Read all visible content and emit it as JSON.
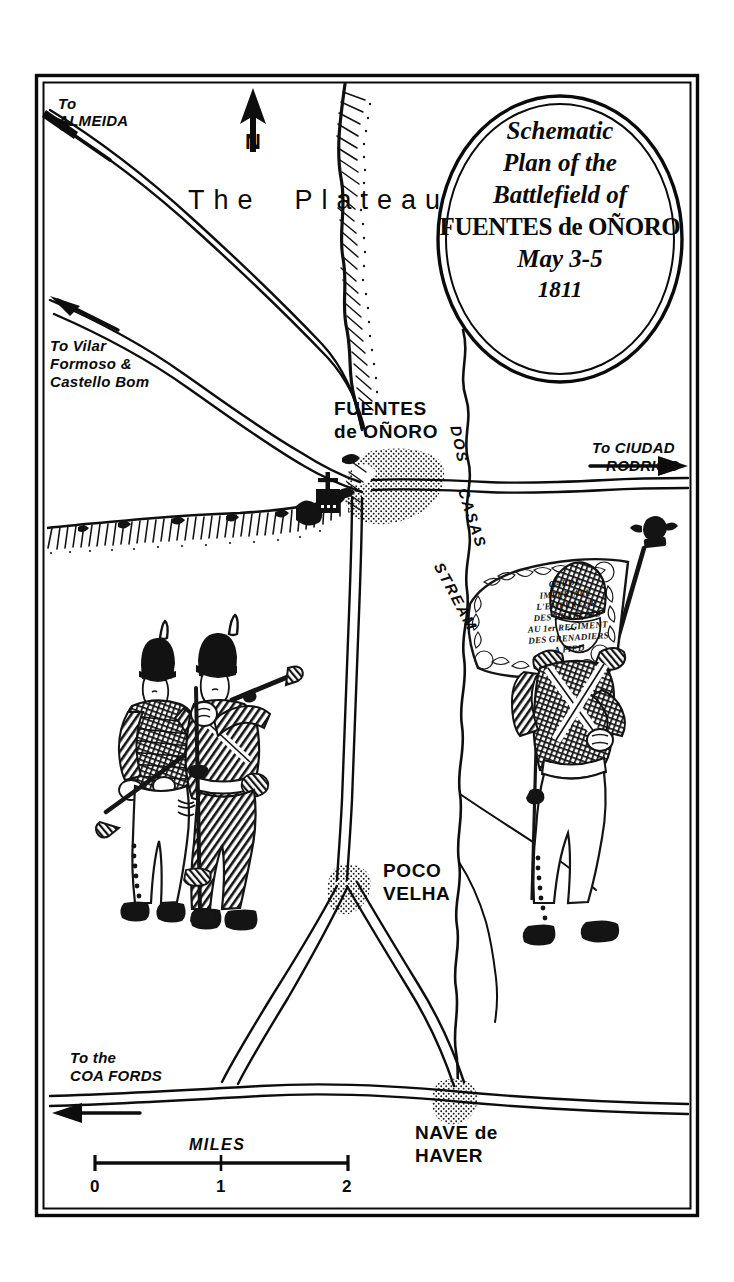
{
  "map": {
    "domain": "historical-battlefield-map",
    "style": "pen-and-ink line drawing, black on white",
    "border": "double-ruled rectangular frame",
    "ink_color": "#0a0a0a",
    "paper_color": "#ffffff"
  },
  "cartouche": {
    "shape": "double-ruled oval",
    "lines": [
      "Schematic",
      "Plan of the",
      "Battlefield of",
      "FUENTES de OÑORO",
      "May 3-5",
      "1811"
    ]
  },
  "compass": {
    "label": "N",
    "direction": "north-arrow pointing up"
  },
  "terrain_labels": {
    "plateau": "The  Plateau"
  },
  "settlements": [
    {
      "name": "fuentes-de-onoro",
      "line1": "FUENTES",
      "line2": "de OÑORO"
    },
    {
      "name": "poco-velha",
      "line1": "POCO",
      "line2": "VELHA"
    },
    {
      "name": "nave-de-haver",
      "line1": "NAVE de",
      "line2": "HAVER"
    }
  ],
  "hydrography": {
    "stream_label": "DOS CASAS STREAM",
    "stream_label_words": [
      "DOS",
      "CASAS",
      "STREAM"
    ]
  },
  "roads": [
    {
      "name": "to-almeida",
      "line1": "To",
      "line2": "ALMEIDA",
      "arrow": "up-left"
    },
    {
      "name": "to-vilar-formoso",
      "line1": "To Vilar",
      "line2": "Formoso &",
      "line3": "Castello Bom",
      "arrow": "up-left"
    },
    {
      "name": "to-ciudad-rodrigo",
      "line1": "To CIUDAD",
      "line2": "RODRIGO",
      "arrow": "right"
    },
    {
      "name": "to-coa-fords",
      "line1": "To the",
      "line2": "COA FORDS",
      "arrow": "left"
    }
  ],
  "scale_bar": {
    "title": "MILES",
    "ticks": [
      "0",
      "1",
      "2"
    ],
    "units": "miles"
  },
  "figures": [
    {
      "name": "british-infantry-pair",
      "description": "two British soldiers in shakos with muskets",
      "position": "left-centre"
    },
    {
      "name": "french-grenadier-standard-bearer",
      "description": "French Imperial Guard grenadier in bearskin holding eagle standard",
      "position": "right-centre"
    }
  ],
  "flag": {
    "name": "french-imperial-eagle-standard",
    "inscription_lines": [
      "GARDE",
      "IMPERIALE",
      "L'EMPEREUR",
      "DES FRANÇAIS",
      "AU 1er REGIMENT",
      "DES GRENADIERS",
      "A PIED"
    ],
    "finial": "imperial eagle"
  },
  "symbols": [
    {
      "name": "church-cross-symbol",
      "description": "cross atop a block, marking the village church"
    },
    {
      "name": "escarpment-hachures",
      "description": "hachured cliff edge running east-west"
    },
    {
      "name": "ridge-hachures",
      "description": "hachured ridge descending from the north border"
    },
    {
      "name": "village-stipple",
      "description": "stippled built-up areas"
    }
  ]
}
